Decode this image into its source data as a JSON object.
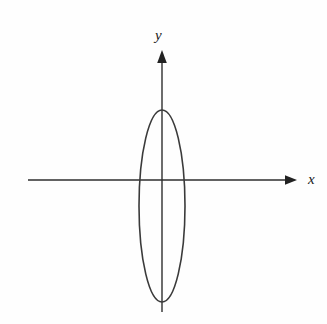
{
  "figure": {
    "background_color": "#fefefe",
    "stroke_color": "#3a3a3a",
    "axis_color": "#2e2e2e",
    "label_color": "#1a1a1a"
  },
  "axes": {
    "x_axis": {
      "label": "x",
      "icon": "arrow-right-icon",
      "start_x": 28,
      "end_x": 297,
      "y": 180,
      "has_arrowhead": true,
      "arrow_direction": "right"
    },
    "y_axis": {
      "label": "y",
      "icon": "arrow-up-icon",
      "x": 162,
      "start_y": 312,
      "end_y": 50,
      "has_arrowhead": true,
      "arrow_direction": "up"
    },
    "origin": {
      "x": 162,
      "y": 180
    }
  },
  "chart_data": {
    "type": "line",
    "xlabel": "x",
    "ylabel": "y",
    "grid": false,
    "legend": false,
    "shapes": [
      {
        "name": "ellipse",
        "type": "ellipse",
        "center_x": 162,
        "center_y": 206,
        "radius_x": 23,
        "radius_y": 96,
        "stroke": "#3a3a3a",
        "stroke_width": 1.6,
        "fill": "none"
      }
    ],
    "annotations": [
      {
        "text": "x",
        "x": 308,
        "y": 180,
        "style": "italic"
      },
      {
        "text": "y",
        "x": 160,
        "y": 36,
        "style": "italic"
      }
    ]
  }
}
